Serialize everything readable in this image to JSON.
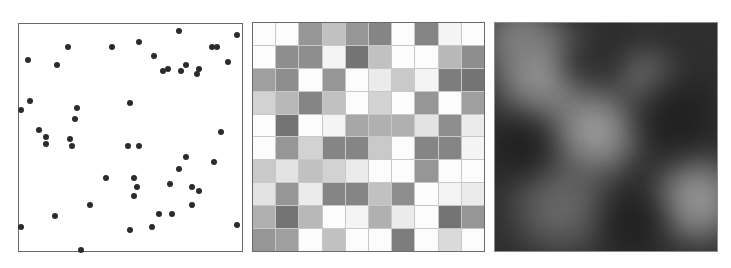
{
  "chart_data": [
    {
      "type": "scatter",
      "title": "",
      "xlabel": "",
      "ylabel": "",
      "xlim": [
        0,
        1
      ],
      "ylim": [
        0,
        1
      ],
      "grid": false,
      "marker_color": "#2b2b2b",
      "points": [
        [
          0.22,
          0.9
        ],
        [
          0.42,
          0.9
        ],
        [
          0.54,
          0.92
        ],
        [
          0.72,
          0.97
        ],
        [
          0.87,
          0.9
        ],
        [
          0.89,
          0.9
        ],
        [
          0.98,
          0.95
        ],
        [
          0.04,
          0.84
        ],
        [
          0.17,
          0.82
        ],
        [
          0.61,
          0.86
        ],
        [
          0.67,
          0.8
        ],
        [
          0.75,
          0.82
        ],
        [
          0.65,
          0.79
        ],
        [
          0.73,
          0.79
        ],
        [
          0.81,
          0.8
        ],
        [
          0.8,
          0.78
        ],
        [
          0.94,
          0.83
        ],
        [
          0.05,
          0.66
        ],
        [
          0.5,
          0.65
        ],
        [
          0.01,
          0.62
        ],
        [
          0.26,
          0.63
        ],
        [
          0.25,
          0.58
        ],
        [
          0.09,
          0.53
        ],
        [
          0.12,
          0.5
        ],
        [
          0.12,
          0.47
        ],
        [
          0.23,
          0.49
        ],
        [
          0.24,
          0.46
        ],
        [
          0.49,
          0.46
        ],
        [
          0.54,
          0.46
        ],
        [
          0.91,
          0.52
        ],
        [
          0.75,
          0.41
        ],
        [
          0.72,
          0.36
        ],
        [
          0.88,
          0.39
        ],
        [
          0.39,
          0.32
        ],
        [
          0.52,
          0.32
        ],
        [
          0.53,
          0.28
        ],
        [
          0.52,
          0.24
        ],
        [
          0.68,
          0.29
        ],
        [
          0.78,
          0.28
        ],
        [
          0.81,
          0.26
        ],
        [
          0.32,
          0.2
        ],
        [
          0.78,
          0.2
        ],
        [
          0.16,
          0.15
        ],
        [
          0.63,
          0.16
        ],
        [
          0.69,
          0.16
        ],
        [
          0.01,
          0.1
        ],
        [
          0.5,
          0.09
        ],
        [
          0.6,
          0.1
        ],
        [
          0.98,
          0.11
        ],
        [
          0.28,
          0.0
        ]
      ]
    },
    {
      "type": "heatmap",
      "title": "",
      "rows": 10,
      "cols": 10,
      "colormap": "grayscale (0=white, 1=dark)",
      "grid": true,
      "values": [
        [
          0.0,
          0.0,
          0.6,
          0.35,
          0.6,
          0.7,
          0.0,
          0.7,
          0.05,
          0.0
        ],
        [
          0.0,
          0.65,
          0.65,
          0.05,
          0.8,
          0.35,
          0.0,
          0.0,
          0.4,
          0.65
        ],
        [
          0.55,
          0.65,
          0.0,
          0.6,
          0.0,
          0.1,
          0.3,
          0.05,
          0.75,
          0.8
        ],
        [
          0.25,
          0.4,
          0.7,
          0.35,
          0.0,
          0.25,
          0.0,
          0.6,
          0.0,
          0.55
        ],
        [
          0.0,
          0.8,
          0.0,
          0.05,
          0.5,
          0.45,
          0.45,
          0.15,
          0.65,
          0.1
        ],
        [
          0.0,
          0.6,
          0.25,
          0.7,
          0.7,
          0.3,
          0.0,
          0.7,
          0.7,
          0.05
        ],
        [
          0.3,
          0.15,
          0.35,
          0.25,
          0.1,
          0.0,
          0.0,
          0.6,
          0.0,
          0.0
        ],
        [
          0.15,
          0.6,
          0.1,
          0.7,
          0.7,
          0.35,
          0.65,
          0.0,
          0.05,
          0.1
        ],
        [
          0.45,
          0.8,
          0.4,
          0.0,
          0.05,
          0.45,
          0.1,
          0.0,
          0.8,
          0.6
        ],
        [
          0.6,
          0.55,
          0.0,
          0.35,
          0.0,
          0.0,
          0.75,
          0.0,
          0.2,
          0.0
        ]
      ]
    },
    {
      "type": "heatmap",
      "title": "",
      "description": "smooth grayscale noise field",
      "colormap": "grayscale",
      "bright_regions": [
        {
          "cx": 0.45,
          "cy": 0.48,
          "r": 0.18,
          "level": 0.75
        },
        {
          "cx": 0.22,
          "cy": 0.22,
          "r": 0.2,
          "level": 0.7
        },
        {
          "cx": 0.92,
          "cy": 0.78,
          "r": 0.17,
          "level": 0.72
        },
        {
          "cx": 0.1,
          "cy": 0.05,
          "r": 0.14,
          "level": 0.5
        },
        {
          "cx": 0.68,
          "cy": 0.25,
          "r": 0.12,
          "level": 0.4
        },
        {
          "cx": 0.3,
          "cy": 0.8,
          "r": 0.2,
          "level": 0.35
        }
      ],
      "dark_regions": [
        {
          "cx": 0.12,
          "cy": 0.55,
          "r": 0.15
        },
        {
          "cx": 0.4,
          "cy": 0.17,
          "r": 0.12
        },
        {
          "cx": 0.82,
          "cy": 0.4,
          "r": 0.18
        },
        {
          "cx": 0.62,
          "cy": 0.88,
          "r": 0.15
        }
      ]
    }
  ]
}
